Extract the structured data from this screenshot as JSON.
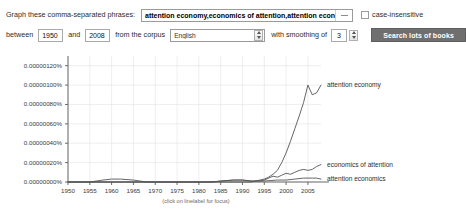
{
  "form": {
    "phrases_label": "Graph these comma-separated phrases:",
    "phrases_value": "attention economy,economics of attention,attention economics",
    "phrases_placeholder": "attention economy,economics of attention,attention economics",
    "dropdown_icon": "chevron-down-icon",
    "case_insensitive_label": "case-insensitive",
    "case_insensitive_checked": false,
    "between_label": "between",
    "year_start": "1950",
    "and_label": "and",
    "year_end": "2008",
    "corpus_label": "from the corpus",
    "corpus_value": "English",
    "corpus_spinner_icon": "spinner-icon",
    "smoothing_label": "with smoothing of",
    "smoothing_value": "3",
    "smoothing_spinner_icon": "spinner-icon",
    "search_button_label": "Search lots of books"
  },
  "chart_data": {
    "type": "line",
    "title": "",
    "xlabel": "",
    "ylabel": "",
    "footnote": "(click on linelabel for focus)",
    "grid": true,
    "legend_position": "right-inline",
    "xlim": [
      1950,
      2008
    ],
    "ylim": [
      0,
      1.3e-06
    ],
    "x_ticks": [
      1950,
      1955,
      1960,
      1965,
      1970,
      1975,
      1980,
      1985,
      1990,
      1995,
      2000,
      2005
    ],
    "y_ticks": [
      0,
      2e-07,
      4e-07,
      6e-07,
      8e-07,
      1e-06,
      1.2e-06
    ],
    "y_tick_labels": [
      "0.00000000%",
      "0.00000020%",
      "0.00000040%",
      "0.00000060%",
      "0.00000080%",
      "0.00000100%",
      "0.00000120%"
    ],
    "line_color": "#555555",
    "series": [
      {
        "name": "attention economy",
        "label": "attention economy",
        "x": [
          1950,
          1955,
          1960,
          1963,
          1966,
          1970,
          1975,
          1980,
          1983,
          1985,
          1988,
          1990,
          1992,
          1994,
          1995,
          1996,
          1997,
          1998,
          1999,
          2000,
          2001,
          2002,
          2003,
          2004,
          2005,
          2006,
          2007,
          2008
        ],
        "values": [
          0,
          0,
          0,
          0,
          0,
          0,
          0,
          0,
          0,
          0,
          0,
          0,
          0,
          2e-08,
          3e-08,
          5e-08,
          8e-08,
          1.2e-07,
          2e-07,
          3e-07,
          4.2e-07,
          5.5e-07,
          6.8e-07,
          8.2e-07,
          1e-06,
          9e-07,
          9.2e-07,
          1e-06
        ]
      },
      {
        "name": "economics of attention",
        "label": "economics of attention",
        "x": [
          1950,
          1955,
          1960,
          1963,
          1966,
          1970,
          1975,
          1980,
          1983,
          1985,
          1988,
          1990,
          1992,
          1994,
          1995,
          1996,
          1997,
          1998,
          1999,
          2000,
          2001,
          2002,
          2003,
          2004,
          2005,
          2006,
          2007,
          2008
        ],
        "values": [
          0,
          0,
          0,
          0,
          0,
          0,
          0,
          0,
          0,
          1e-08,
          2e-08,
          2e-08,
          1e-08,
          1e-08,
          2e-08,
          4e-08,
          6e-08,
          5e-08,
          7e-08,
          9e-08,
          8e-08,
          1e-07,
          1.2e-07,
          1.3e-07,
          1.2e-07,
          1.3e-07,
          1.6e-07,
          1.8e-07
        ]
      },
      {
        "name": "attention economics",
        "label": "attention economics",
        "x": [
          1950,
          1955,
          1958,
          1960,
          1962,
          1965,
          1968,
          1970,
          1975,
          1980,
          1983,
          1985,
          1988,
          1990,
          1992,
          1995,
          1998,
          2000,
          2002,
          2004,
          2005,
          2006,
          2007,
          2008
        ],
        "values": [
          0,
          0,
          2e-08,
          3e-08,
          3e-08,
          2e-08,
          0,
          0,
          0,
          0,
          0,
          1e-08,
          2e-08,
          2e-08,
          1e-08,
          1e-08,
          2e-08,
          2e-08,
          3e-08,
          4e-08,
          4e-08,
          4e-08,
          4e-08,
          3e-08
        ]
      }
    ]
  }
}
